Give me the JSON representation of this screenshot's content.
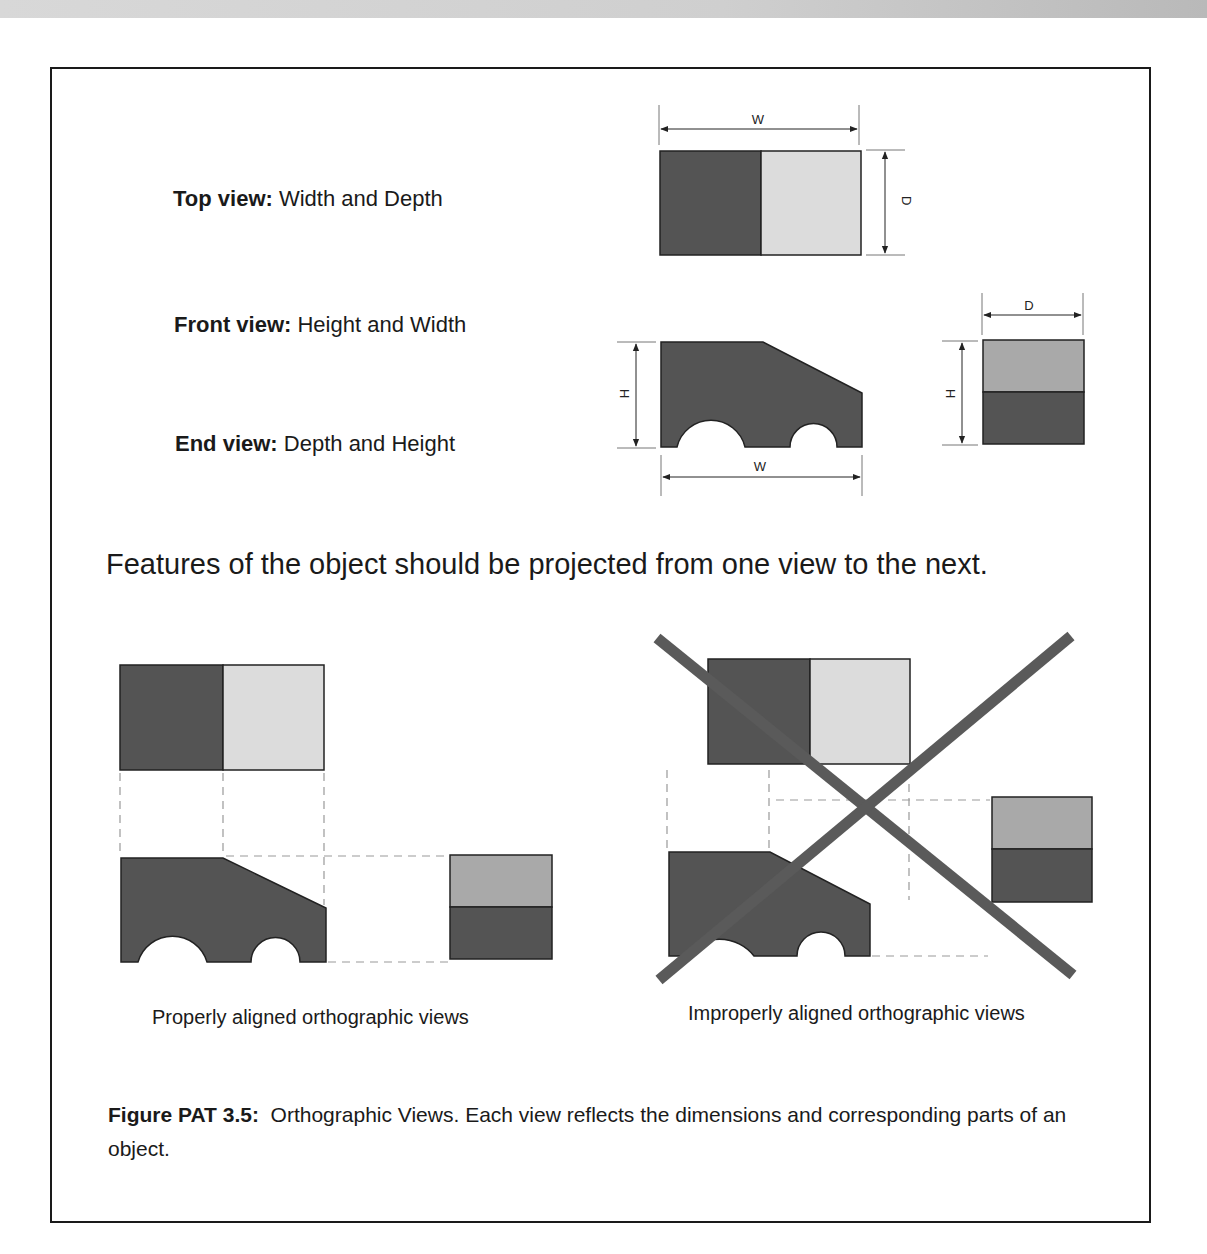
{
  "views": [
    {
      "name_label": "Top view:",
      "description": "Width and Depth"
    },
    {
      "name_label": "Front view:",
      "description": "Height and Width"
    },
    {
      "name_label": "End view:",
      "description": "Depth and Height"
    }
  ],
  "dimensions": {
    "top_width": "W",
    "top_depth": "D",
    "front_height": "H",
    "front_width": "W",
    "end_depth": "D",
    "end_height": "H"
  },
  "headline": "Features of the object should be projected from one view to the next.",
  "examples": {
    "proper_label": "Properly aligned orthographic views",
    "improper_label": "Improperly aligned orthographic views"
  },
  "figure_caption": {
    "number": "Figure PAT 3.5:",
    "text": "Orthographic Views. Each view reflects the dimensions and corresponding parts of an object."
  },
  "colors": {
    "dark_fill": "#545454",
    "light_fill": "#dcdcdc",
    "mid_fill": "#a9a9a9",
    "cross": "#5a5a5a",
    "dashed": "#999999"
  }
}
